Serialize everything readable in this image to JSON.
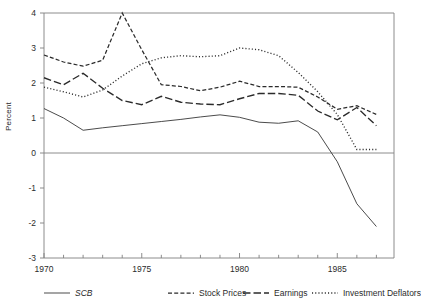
{
  "figure": {
    "ylabel": "Percent",
    "y_ticks": [
      "4",
      "3",
      "2",
      "1",
      "0",
      "-1",
      "-2",
      "-3"
    ],
    "x_ticks": [
      "1970",
      "1975",
      "1980",
      "1985"
    ],
    "ink_color": "#2b2b2b",
    "axis_color": "#808080"
  },
  "legend": {
    "position": "below-axes",
    "items": [
      {
        "label": "SCB",
        "style": "solid",
        "italic": true,
        "name": "legend-item-scb"
      },
      {
        "label": "Stock Prices",
        "style": "dashed",
        "italic": false,
        "name": "legend-item-stock-prices"
      },
      {
        "label": "Earnings",
        "style": "long-dash",
        "italic": false,
        "name": "legend-item-earnings"
      },
      {
        "label": "Investment Deflators",
        "style": "dotted",
        "italic": false,
        "name": "legend-item-investment-deflators"
      }
    ]
  },
  "chart_data": {
    "type": "line",
    "title": "",
    "xlabel": "",
    "ylabel": "Percent",
    "xlim": [
      1970,
      1987.9
    ],
    "ylim": [
      -3,
      4
    ],
    "grid": false,
    "legend_position": "bottom",
    "x": [
      1970,
      1971,
      1972,
      1973,
      1974,
      1975,
      1976,
      1977,
      1978,
      1979,
      1980,
      1981,
      1982,
      1983,
      1984,
      1985,
      1986,
      1987
    ],
    "series": [
      {
        "name": "SCB",
        "style": "solid",
        "values": [
          1.27,
          1.0,
          0.65,
          0.72,
          0.78,
          0.84,
          0.9,
          0.96,
          1.03,
          1.09,
          1.02,
          0.88,
          0.85,
          0.92,
          0.6,
          -0.25,
          -1.45,
          -2.1
        ]
      },
      {
        "name": "Stock Prices",
        "style": "dashed",
        "values": [
          2.8,
          2.6,
          2.48,
          2.65,
          4.0,
          2.95,
          1.95,
          1.9,
          1.78,
          1.88,
          2.05,
          1.9,
          1.9,
          1.88,
          1.6,
          1.25,
          1.35,
          1.1
        ]
      },
      {
        "name": "Earnings",
        "style": "long-dash",
        "values": [
          2.15,
          1.95,
          2.28,
          1.85,
          1.5,
          1.38,
          1.62,
          1.45,
          1.4,
          1.38,
          1.55,
          1.7,
          1.7,
          1.65,
          1.2,
          0.95,
          1.3,
          0.78
        ]
      },
      {
        "name": "Investment Deflators",
        "style": "dotted",
        "values": [
          1.88,
          1.75,
          1.6,
          1.8,
          2.2,
          2.55,
          2.72,
          2.78,
          2.75,
          2.78,
          3.0,
          2.95,
          2.78,
          2.3,
          1.75,
          1.1,
          0.1,
          0.1
        ]
      }
    ]
  }
}
